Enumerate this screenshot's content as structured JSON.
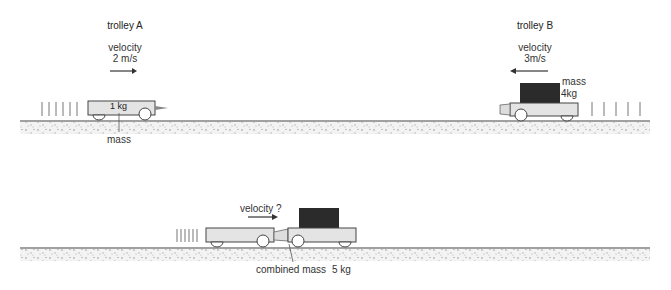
{
  "scene1": {
    "trolley_a": {
      "title": "trolley A",
      "velocity_label": "velocity",
      "velocity_value": "2 m/s",
      "mass_text": "1 kg",
      "mass_label": "mass",
      "direction": "right"
    },
    "trolley_b": {
      "title": "trolley B",
      "velocity_label": "velocity",
      "velocity_value": "3m/s",
      "mass_label": "mass",
      "mass_value": "4kg",
      "direction": "left"
    }
  },
  "scene2": {
    "velocity_label": "velocity ?",
    "combined_label": "combined mass",
    "combined_value": "5 kg",
    "direction": "right"
  },
  "colors": {
    "trolley_fill": "#e4e4e4",
    "load_fill": "#2b2b2b",
    "outline": "#444444",
    "ground": "#bdbdbd"
  }
}
